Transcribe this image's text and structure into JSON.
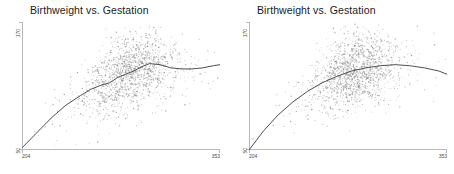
{
  "chart_data": [
    {
      "type": "scatter",
      "title": "Birthweight vs. Gestation",
      "xlabel": "",
      "ylabel": "",
      "xlim": [
        204,
        353
      ],
      "ylim": [
        50,
        170
      ],
      "xticks": [
        "204",
        "353"
      ],
      "yticks": [
        "50",
        "170"
      ],
      "grid": false,
      "legend": "none",
      "point_color": "#8c8c8c",
      "curve_color": "#4f4f4f",
      "series": [
        {
          "name": "smoothed fit (wiggly loess)",
          "x": [
            204,
            215,
            226,
            237,
            248,
            256,
            264,
            270,
            276,
            282,
            288,
            294,
            300,
            308,
            316,
            324,
            332,
            340,
            348,
            353
          ],
          "y": [
            52,
            66,
            80,
            92,
            101,
            107,
            111,
            113,
            118,
            121,
            124,
            128,
            131,
            130,
            127,
            126,
            126,
            127,
            129,
            130
          ]
        }
      ],
      "scatter_note": "dense gray point cloud concentrated between x 270-300, widening in y from 60 to 168"
    },
    {
      "type": "scatter",
      "title": "Birthweight vs. Gestation",
      "xlabel": "",
      "ylabel": "",
      "xlim": [
        204,
        353
      ],
      "ylim": [
        50,
        170
      ],
      "xticks": [
        "204",
        "353"
      ],
      "yticks": [
        "50",
        "170"
      ],
      "grid": false,
      "legend": "none",
      "point_color": "#8c8c8c",
      "curve_color": "#4f4f4f",
      "series": [
        {
          "name": "smoothed fit (quadratic)",
          "x": [
            204,
            215,
            226,
            237,
            248,
            259,
            270,
            281,
            292,
            303,
            314,
            325,
            336,
            347,
            353
          ],
          "y": [
            50,
            68,
            83,
            95,
            105,
            113,
            119,
            124,
            127,
            129,
            130,
            129,
            127,
            124,
            121
          ]
        }
      ],
      "scatter_note": "dense gray point cloud concentrated between x 265-300, widening in y from 60 to 168"
    }
  ],
  "panels": [
    {
      "title": "Birthweight vs. Gestation",
      "y_top": "170",
      "y_bottom": "50",
      "x_left": "204",
      "x_right": "353"
    },
    {
      "title": "Birthweight vs. Gestation",
      "y_top": "170",
      "y_bottom": "50",
      "x_left": "204",
      "x_right": "353"
    }
  ]
}
